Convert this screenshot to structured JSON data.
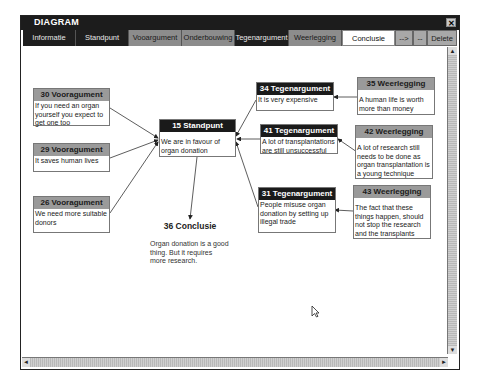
{
  "window": {
    "title": "DIAGRAM",
    "close_icon": "close-icon"
  },
  "tabs": [
    {
      "label": "Informatie",
      "style": "dark"
    },
    {
      "label": "Standpunt",
      "style": "dark"
    },
    {
      "label": "Vooargument",
      "style": "grey"
    },
    {
      "label": "Onderbouwing",
      "style": "grey"
    },
    {
      "label": "Tegenargument",
      "style": "dark"
    },
    {
      "label": "Weerlegging",
      "style": "grey"
    },
    {
      "label": "Conclusie",
      "style": "white"
    },
    {
      "label": "-->",
      "style": "btn"
    },
    {
      "label": "--",
      "style": "btn"
    },
    {
      "label": "Delete",
      "style": "btn"
    }
  ],
  "nodes": {
    "n30": {
      "title": "30 Vooragument",
      "text": "If you need an organ yourself you expect to get one too"
    },
    "n29": {
      "title": "29 Vooragument",
      "text": "It saves human lives"
    },
    "n26": {
      "title": "26 Vooragument",
      "text": "We need more suitable donors"
    },
    "n15": {
      "title": "15 Standpunt",
      "text": "We are in favour of organ donation"
    },
    "n34": {
      "title": "34 Tegenargument",
      "text": "It is very expensive"
    },
    "n41": {
      "title": "41 Tegenargument",
      "text": "A lot of transplantations are still unsuccessful"
    },
    "n31": {
      "title": "31 Tegenargument",
      "text": "People misuse organ donation by setting up illegal trade"
    },
    "n35": {
      "title": "35 Weerlegging",
      "text": "A human life is worth more than money"
    },
    "n42": {
      "title": "42 Weerlegging",
      "text": "A lot of research still needs to be done as organ transplantation is a young technique"
    },
    "n43": {
      "title": "43 Weerlegging",
      "text": "The fact that these things happen, should not stop the research and the transplants"
    },
    "n36": {
      "title": "36 Conclusie",
      "text": "Organ donation is a good thing. But it requires more research."
    }
  },
  "scrollbars": {
    "up": "▲",
    "down": "▼",
    "left": "◄",
    "right": "►"
  }
}
